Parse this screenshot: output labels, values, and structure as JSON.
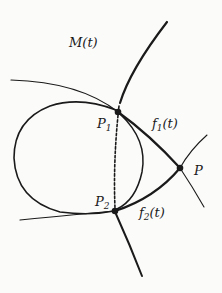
{
  "diagram": {
    "labels": {
      "curve": "M(t)",
      "p1_base": "P",
      "p1_sub": "1",
      "p2_base": "P",
      "p2_sub": "2",
      "p": "P",
      "f1_base": "f",
      "f1_sub": "1",
      "f1_arg": "(t)",
      "f2_base": "f",
      "f2_sub": "2",
      "f2_arg": "(t)"
    },
    "points": {
      "P1": [
        118,
        112
      ],
      "P2": [
        115,
        211
      ],
      "P": [
        180,
        168
      ]
    },
    "colors": {
      "ink": "#1a1a1a",
      "background": "#fbfbfa"
    }
  }
}
